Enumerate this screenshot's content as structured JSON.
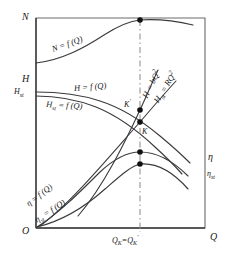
{
  "figure": {
    "type": "diagram",
    "axes": {
      "x_axis_label": "Q",
      "y_axis_labels": [
        "N",
        "H",
        "Hₛₜ"
      ],
      "right_axis_labels": [
        "η",
        "ηₛₜ"
      ],
      "origin_label": "O",
      "x_tick_label": "Qₖ = Qₖ′"
    },
    "axis_labels": {
      "N": {
        "base": "N"
      },
      "H": {
        "base": "H"
      },
      "H_st": {
        "base": "H",
        "sub": "st"
      },
      "eta": {
        "base": "η"
      },
      "eta_st": {
        "base": "η",
        "sub": "st"
      },
      "Q": {
        "base": "Q"
      },
      "O": {
        "base": "O"
      }
    },
    "curve_labels": [
      {
        "id": "N-curve-label",
        "base": "N",
        "eq": " = f (Q)"
      },
      {
        "id": "H-curve-label",
        "base": "H",
        "eq": " = f (Q)"
      },
      {
        "id": "H-st-curve-label",
        "base": "H",
        "sub": "st",
        "eq": " = f (Q)"
      },
      {
        "id": "eta-curve-label",
        "base": "η",
        "eq": " = f (Q)"
      },
      {
        "id": "eta-st-curve-label",
        "base": "η",
        "sub": "st",
        "eq": " = f (Q)"
      },
      {
        "id": "head-parabola-label",
        "base": "H",
        "eq": " = bQ",
        "sup": "2"
      },
      {
        "id": "head-st-parabola-label",
        "base": "H",
        "sub": "st",
        "eq": " = RQ",
        "sup": "2"
      }
    ],
    "point_labels": [
      {
        "id": "point-k-prime",
        "base": "K",
        "sup": "′"
      },
      {
        "id": "point-k",
        "base": "K"
      }
    ],
    "x_tick": {
      "left_base": "Q",
      "left_sub": "K",
      "equals": "=",
      "right_base": "Q",
      "right_sub": "K",
      "right_prime": "′"
    },
    "colors": {
      "stroke": "#3a3a3a",
      "frame": "#555555",
      "dashed": "#8a8a8a",
      "dot": "#111111",
      "background": "#ffffff"
    },
    "geometry": {
      "frame": {
        "x0": 36,
        "y0": 18,
        "x1": 205,
        "y1": 228
      },
      "dash_x": 140,
      "intersection_points": [
        {
          "name": "N-peak-dot",
          "x": 140,
          "y": 20
        },
        {
          "name": "K-prime-dot",
          "x": 140,
          "y": 110
        },
        {
          "name": "K-dot",
          "x": 140,
          "y": 122
        },
        {
          "name": "eta-dot",
          "x": 140,
          "y": 152
        },
        {
          "name": "eta-st-dot",
          "x": 140,
          "y": 164
        }
      ]
    }
  }
}
